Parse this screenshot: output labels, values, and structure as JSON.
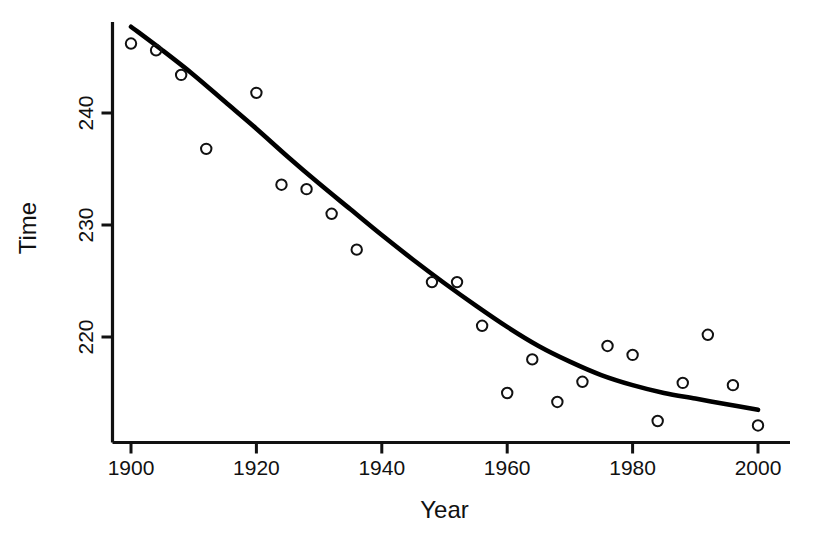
{
  "chart_data": {
    "type": "scatter",
    "title": "",
    "subtitle": "",
    "xlabel": "Year",
    "ylabel": "Time",
    "xlim": [
      1897,
      2004
    ],
    "ylim": [
      210.5,
      248.5
    ],
    "xticks": [
      1900,
      1920,
      1940,
      1960,
      1980,
      2000
    ],
    "xticklabels": [
      "1900",
      "1920",
      "1940",
      "1960",
      "1980",
      "2000"
    ],
    "yticks": [
      220,
      230,
      240
    ],
    "yticklabels": [
      "220",
      "230",
      "240"
    ],
    "grid": false,
    "legend": null,
    "annotations": [],
    "series": [
      {
        "name": "Observed winning times",
        "type": "scatter",
        "marker": "open-circle",
        "color": "#111111",
        "x": [
          1900,
          1904,
          1908,
          1912,
          1920,
          1924,
          1928,
          1932,
          1936,
          1948,
          1952,
          1956,
          1960,
          1964,
          1968,
          1972,
          1976,
          1980,
          1984,
          1988,
          1992,
          1996,
          2000
        ],
        "y": [
          246.2,
          245.6,
          243.4,
          236.8,
          241.8,
          233.6,
          233.2,
          231.0,
          227.8,
          224.9,
          224.9,
          221.0,
          215.0,
          218.0,
          214.2,
          216.0,
          219.2,
          218.4,
          212.5,
          215.9,
          220.2,
          215.7,
          212.1
        ]
      },
      {
        "name": "Fitted quadratic trend",
        "type": "line",
        "color": "#000000",
        "x": [
          1900,
          1905,
          1910,
          1915,
          1920,
          1925,
          1930,
          1935,
          1940,
          1945,
          1950,
          1955,
          1960,
          1965,
          1970,
          1975,
          1980,
          1985,
          1990,
          1995,
          2000
        ],
        "y": [
          247.7,
          245.6,
          243.4,
          241.0,
          238.6,
          236.1,
          233.7,
          231.4,
          229.1,
          226.9,
          224.8,
          222.8,
          220.9,
          219.2,
          217.8,
          216.6,
          215.7,
          215.0,
          214.5,
          214.0,
          213.5
        ]
      }
    ]
  },
  "axes": {
    "y_title": "Time",
    "x_title": "Year"
  }
}
